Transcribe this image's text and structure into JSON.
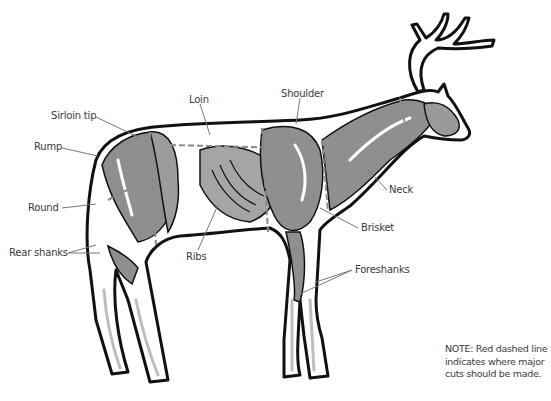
{
  "diagram": {
    "labels": [
      {
        "id": "sirloin-tip",
        "text": "Sirloin tip",
        "x": 51,
        "y": 110
      },
      {
        "id": "loin",
        "text": "Loin",
        "x": 189,
        "y": 94
      },
      {
        "id": "shoulder",
        "text": "Shoulder",
        "x": 281,
        "y": 88
      },
      {
        "id": "rump",
        "text": "Rump",
        "x": 34,
        "y": 141
      },
      {
        "id": "round",
        "text": "Round",
        "x": 28,
        "y": 202
      },
      {
        "id": "rear-shanks",
        "text": "Rear shanks",
        "x": 9,
        "y": 247
      },
      {
        "id": "neck",
        "text": "Neck",
        "x": 389,
        "y": 184
      },
      {
        "id": "brisket",
        "text": "Brisket",
        "x": 361,
        "y": 222
      },
      {
        "id": "ribs",
        "text": "Ribs",
        "x": 186,
        "y": 251
      },
      {
        "id": "foreshanks",
        "text": "Foreshanks",
        "x": 355,
        "y": 264
      }
    ],
    "note": {
      "lines": [
        "NOTE: Red dashed line",
        "indicates where major",
        "cuts should be made."
      ]
    },
    "colors": {
      "outline": "#111111",
      "muscle": "#8f8f8f",
      "muscle_light": "#bdbdbd",
      "leader_line": "#777777",
      "cut_line": "#8a8a8a",
      "label_text": "#3a3a3a"
    }
  }
}
